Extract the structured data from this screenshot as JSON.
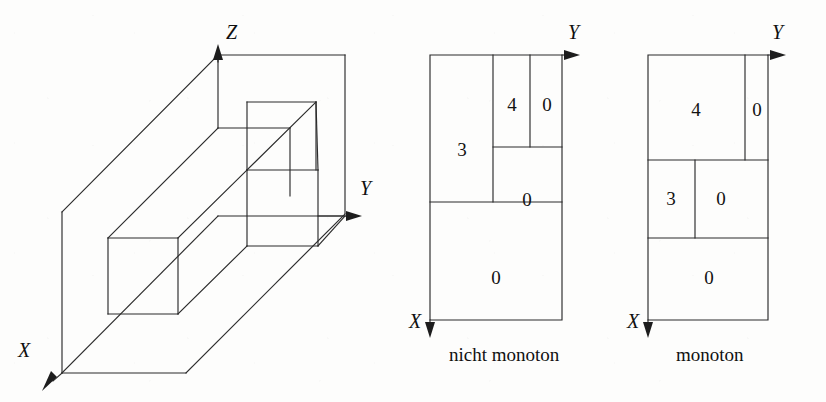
{
  "figure": {
    "background_color": "#fdfdfc",
    "line_color": "#2b2b2b"
  },
  "panels": [
    {
      "id": "isometric-block-diagram",
      "kind": "3d-isometric",
      "axes": [
        {
          "name": "z-axis",
          "label": "Z",
          "direction": "up"
        },
        {
          "name": "y-axis",
          "label": "Y",
          "direction": "right"
        },
        {
          "name": "x-axis",
          "label": "X",
          "direction": "down-left"
        }
      ],
      "caption": ""
    },
    {
      "id": "non-monotone-subdivision",
      "kind": "2d-subdivision",
      "axes": [
        {
          "name": "y-axis",
          "label": "Y",
          "direction": "right"
        },
        {
          "name": "x-axis",
          "label": "X",
          "direction": "down"
        }
      ],
      "caption": "nicht monoton",
      "cells": [
        {
          "name": "cell-left-tall",
          "value": "3"
        },
        {
          "name": "cell-top-middle",
          "value": "4"
        },
        {
          "name": "cell-top-right",
          "value": "0"
        },
        {
          "name": "cell-middle-right",
          "value": "0"
        },
        {
          "name": "cell-bottom-wide",
          "value": "0"
        }
      ]
    },
    {
      "id": "monotone-subdivision",
      "kind": "2d-subdivision",
      "axes": [
        {
          "name": "y-axis",
          "label": "Y",
          "direction": "right"
        },
        {
          "name": "x-axis",
          "label": "X",
          "direction": "down"
        }
      ],
      "caption": "monoton",
      "cells": [
        {
          "name": "cell-top-wide",
          "value": "4"
        },
        {
          "name": "cell-top-right",
          "value": "0"
        },
        {
          "name": "cell-middle-left",
          "value": "3"
        },
        {
          "name": "cell-middle-right",
          "value": "0"
        },
        {
          "name": "cell-bottom-wide",
          "value": "0"
        }
      ]
    }
  ]
}
